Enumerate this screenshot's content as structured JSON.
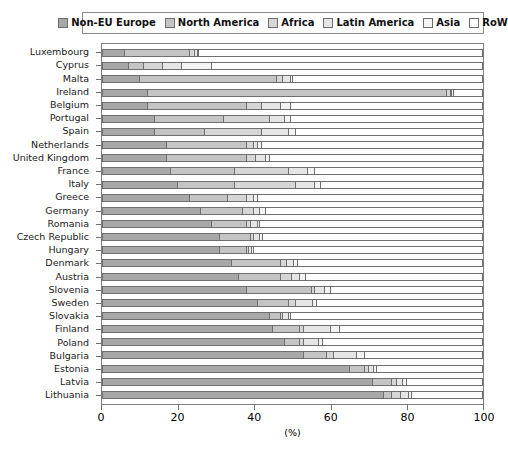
{
  "chart_data": {
    "type": "bar",
    "subtype": "stacked-horizontal-bar",
    "title": "",
    "xlabel": "(%)",
    "ylabel": "",
    "xlim": [
      0,
      100
    ],
    "xticks": [
      0,
      20,
      40,
      60,
      80,
      100
    ],
    "xtick_labels": [
      "0",
      "20",
      "40",
      "60",
      "80",
      "100"
    ],
    "grid": false,
    "legend_position": "top",
    "stacked_to_100": true,
    "series": [
      {
        "name": "Non-EU Europe",
        "color": "#a8a8a8"
      },
      {
        "name": "North America",
        "color": "#c4c4c4"
      },
      {
        "name": "Africa",
        "color": "#d6d6d6"
      },
      {
        "name": "Latin America",
        "color": "#e6e6e6"
      },
      {
        "name": "Asia",
        "color": "#f4f4f4"
      },
      {
        "name": "RoW",
        "color": "#ffffff"
      }
    ],
    "categories": [
      "Luxembourg",
      "Cyprus",
      "Malta",
      "Ireland",
      "Belgium",
      "Portugal",
      "Spain",
      "Netherlands",
      "United Kingdom",
      "France",
      "Italy",
      "Greece",
      "Germany",
      "Romania",
      "Czech Republic",
      "Hungary",
      "Denmark",
      "Austria",
      "Slovenia",
      "Sweden",
      "Slovakia",
      "Finland",
      "Poland",
      "Bulgaria",
      "Estonia",
      "Latvia",
      "Lithuania"
    ],
    "values": [
      [
        6.0,
        17.0,
        1.5,
        0.6,
        0.4,
        74.5
      ],
      [
        7.0,
        4.0,
        5.0,
        5.0,
        8.0,
        71.0
      ],
      [
        10.0,
        36.0,
        1.5,
        2.0,
        0.6,
        49.9
      ],
      [
        12.0,
        78.5,
        1.0,
        0.5,
        0.5,
        7.5
      ],
      [
        12.0,
        26.0,
        4.0,
        5.0,
        2.5,
        50.5
      ],
      [
        14.0,
        18.0,
        12.0,
        4.0,
        1.5,
        50.5
      ],
      [
        14.0,
        13.0,
        15.0,
        7.0,
        2.0,
        49.0
      ],
      [
        17.0,
        21.0,
        2.0,
        1.0,
        1.0,
        58.0
      ],
      [
        17.0,
        21.0,
        2.5,
        2.5,
        1.0,
        56.0
      ],
      [
        18.0,
        17.0,
        14.0,
        5.0,
        2.0,
        44.0
      ],
      [
        20.0,
        15.0,
        16.0,
        5.0,
        1.5,
        42.5
      ],
      [
        23.0,
        10.0,
        5.0,
        2.0,
        1.0,
        59.0
      ],
      [
        26.0,
        11.0,
        3.0,
        1.5,
        1.5,
        57.0
      ],
      [
        29.0,
        9.0,
        1.0,
        2.0,
        0.6,
        58.4
      ],
      [
        31.0,
        8.0,
        0.8,
        1.6,
        0.8,
        57.8
      ],
      [
        31.0,
        7.0,
        0.5,
        1.0,
        0.5,
        60.0
      ],
      [
        34.0,
        13.0,
        1.5,
        2.0,
        1.0,
        48.5
      ],
      [
        36.0,
        11.0,
        3.0,
        2.0,
        1.5,
        46.5
      ],
      [
        38.0,
        17.0,
        1.0,
        2.5,
        1.5,
        40.0
      ],
      [
        41.0,
        8.0,
        2.0,
        4.5,
        1.0,
        43.5
      ],
      [
        44.0,
        3.0,
        0.5,
        1.5,
        0.5,
        50.5
      ],
      [
        45.0,
        7.0,
        1.0,
        7.0,
        2.5,
        37.5
      ],
      [
        48.0,
        4.0,
        1.0,
        4.0,
        1.0,
        42.0
      ],
      [
        53.0,
        6.0,
        2.0,
        6.0,
        2.0,
        31.0
      ],
      [
        65.0,
        4.0,
        1.0,
        1.5,
        0.8,
        27.7
      ],
      [
        71.0,
        5.0,
        1.5,
        1.5,
        1.0,
        20.0
      ],
      [
        74.0,
        2.0,
        2.5,
        2.0,
        1.0,
        18.5
      ]
    ]
  },
  "axis": {
    "x_title": "(%)"
  }
}
